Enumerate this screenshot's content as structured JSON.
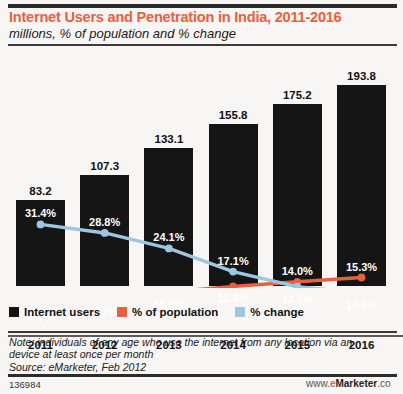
{
  "header": {
    "title": "Internet Users and Penetration in India, 2011-2016",
    "subtitle": "millions, % of population and % change"
  },
  "legend": [
    {
      "label": "Internet users",
      "color": "#151515",
      "name": "internet-users"
    },
    {
      "label": "% of population",
      "color": "#e8603c",
      "name": "pct-of-population"
    },
    {
      "label": "% change",
      "color": "#9dc6e0",
      "name": "pct-change"
    }
  ],
  "note": {
    "line1": "Note: individuals of any age who use the internet from any location via an",
    "line2": "device at least once per month",
    "line3": "Source: eMarketer, Feb 2012"
  },
  "footer": {
    "id": "136984",
    "watermark_prefix": "www.",
    "watermark_e": "e",
    "watermark_name": "Marketer",
    "watermark_suffix": ".co"
  },
  "chart_data": {
    "type": "bar",
    "title": "Internet Users and Penetration in India, 2011-2016",
    "subtitle": "millions, % of population and % change",
    "xlabel": "",
    "ylabel": "",
    "grid": false,
    "legend_position": "bottom-left",
    "categories": [
      "2011",
      "2012",
      "2013",
      "2014",
      "2015",
      "2016"
    ],
    "series": [
      {
        "name": "Internet users",
        "type": "bar",
        "unit": "millions",
        "color": "#151515",
        "values": [
          83.2,
          107.3,
          133.1,
          155.8,
          175.2,
          193.8
        ],
        "labels": [
          "83.2",
          "107.3",
          "133.1",
          "155.8",
          "175.2",
          "193.8"
        ]
      },
      {
        "name": "% of population",
        "type": "line",
        "unit": "%",
        "color": "#e8603c",
        "values": [
          7.0,
          8.9,
          10.9,
          12.6,
          14.0,
          15.3
        ],
        "labels": [
          "7.0%",
          "8.9%",
          "10.9%",
          "12.6%",
          "14.0%",
          "15.3%"
        ]
      },
      {
        "name": "% change",
        "type": "line",
        "unit": "%",
        "color": "#9dc6e0",
        "values": [
          31.4,
          28.8,
          24.1,
          17.1,
          12.5,
          10.6
        ],
        "labels": [
          "31.4%",
          "28.8%",
          "24.1%",
          "17.1%",
          "12.5%",
          "10.6%"
        ]
      }
    ],
    "bar_ylim": [
      0,
      210
    ],
    "line_ylim": [
      0,
      40
    ]
  }
}
